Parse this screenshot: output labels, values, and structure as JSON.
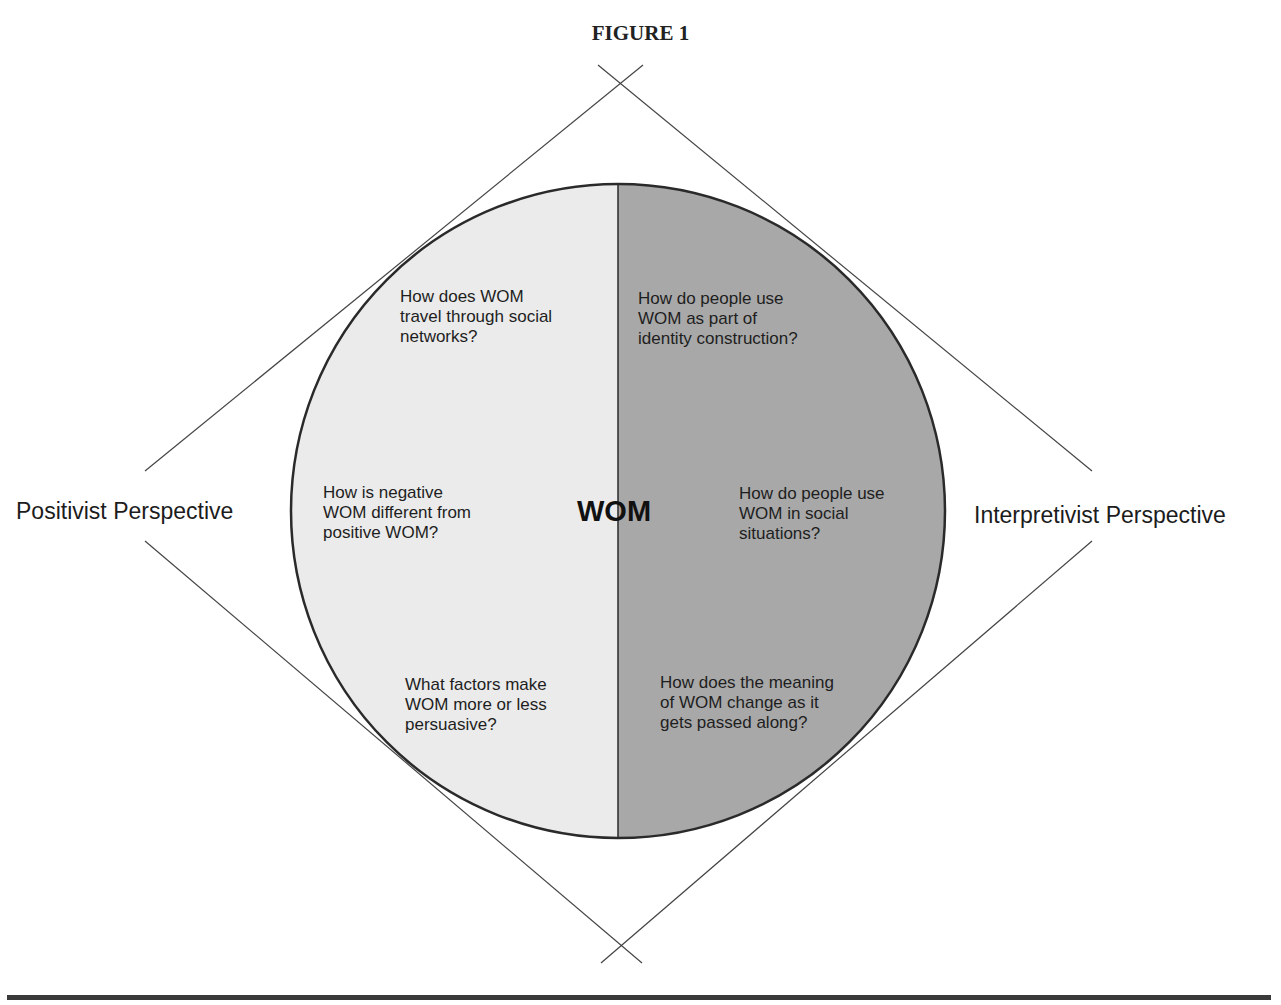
{
  "figure": {
    "title": "FIGURE 1",
    "center_label": "WOM",
    "left_perspective": "Positivist Perspective",
    "right_perspective": "Interpretivist Perspective",
    "left_questions": [
      "How does WOM\ntravel through social\nnetworks?",
      "How is negative\nWOM different from\npositive WOM?",
      "What factors make\nWOM more or less\npersuasive?"
    ],
    "right_questions": [
      "How do people use\nWOM as part of\nidentity construction?",
      "How do people use\nWOM in social\nsituations?",
      "How does the meaning\nof WOM change as it\ngets passed along?"
    ],
    "colors": {
      "left_half": "#ebebeb",
      "right_half": "#a8a8a8",
      "outline": "#2a2a2a",
      "lines": "#444444"
    }
  }
}
